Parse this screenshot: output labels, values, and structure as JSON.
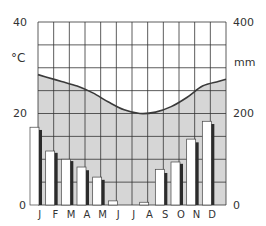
{
  "chart_data": {
    "type": "climograph",
    "title": "",
    "categories": [
      "J",
      "F",
      "M",
      "A",
      "M",
      "J",
      "J",
      "A",
      "S",
      "O",
      "N",
      "D"
    ],
    "left_axis": {
      "label": "°C",
      "ticks": [
        "0",
        "20",
        "40"
      ],
      "range": [
        0,
        40
      ]
    },
    "right_axis": {
      "label": "mm",
      "ticks": [
        "0",
        "200",
        "400"
      ],
      "range": [
        0,
        400
      ]
    },
    "grid": true,
    "series": [
      {
        "name": "Temperature",
        "type": "area-line",
        "axis": "left",
        "unit": "°C",
        "values": [
          28,
          27,
          26,
          24.5,
          22.5,
          20.8,
          20,
          20.3,
          21.5,
          23.5,
          26,
          27
        ]
      },
      {
        "name": "Precipitation (white)",
        "type": "bar",
        "axis": "right",
        "unit": "mm",
        "values": [
          170,
          118,
          100,
          83,
          61,
          9,
          0,
          6,
          78,
          94,
          144,
          183
        ]
      },
      {
        "name": "Precipitation (dark)",
        "type": "bar",
        "axis": "right",
        "unit": "mm",
        "values": [
          164,
          114,
          96,
          76,
          55,
          0,
          0,
          0,
          70,
          90,
          137,
          177
        ]
      }
    ],
    "colors": {
      "fill": "#d6d6d6",
      "line": "#3a3a3a",
      "bar_light": "#ffffff",
      "bar_dark": "#2b2b2b",
      "grid": "#333333"
    }
  },
  "axes": {
    "left_top": "40",
    "left_mid": "20",
    "left_zero": "0",
    "left_unit": "°C",
    "right_top": "400",
    "right_mid": "200",
    "right_zero": "0",
    "right_unit": "mm"
  }
}
